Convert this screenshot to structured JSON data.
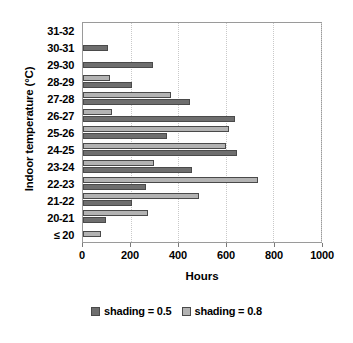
{
  "chart_data": {
    "type": "bar",
    "orientation": "horizontal",
    "title": "",
    "xlabel": "Hours",
    "ylabel": "Indoor temperature (°C)",
    "xlim": [
      0,
      1000
    ],
    "xticks": [
      0,
      200,
      400,
      600,
      800,
      1000
    ],
    "xtick_labels": [
      "0",
      "200",
      "400",
      "600",
      "800",
      "1000"
    ],
    "grid": "vertical-dotted",
    "legend_position": "bottom-center",
    "categories": [
      "31-32",
      "30-31",
      "29-30",
      "28-29",
      "27-28",
      "26-27",
      "25-26",
      "24-25",
      "23-24",
      "22-23",
      "21-22",
      "20-21",
      "≤ 20"
    ],
    "series": [
      {
        "name": "shading = 0.5",
        "color": "#6e6e6e",
        "values": [
          0,
          104,
          296,
          205,
          451,
          640,
          355,
          648,
          460,
          265,
          205,
          95,
          0
        ]
      },
      {
        "name": "shading = 0.8",
        "color": "#b3b3b3",
        "values": [
          0,
          0,
          0,
          113,
          370,
          120,
          615,
          600,
          300,
          735,
          488,
          275,
          75
        ]
      }
    ]
  },
  "legend": {
    "items": [
      {
        "label": "shading = 0.5",
        "color": "#6e6e6e"
      },
      {
        "label": "shading = 0.8",
        "color": "#b3b3b3"
      }
    ]
  }
}
